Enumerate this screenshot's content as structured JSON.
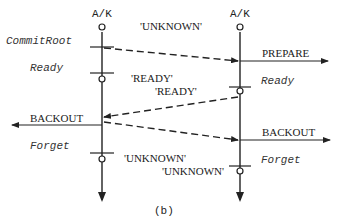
{
  "diagram": {
    "caption": "(b)",
    "participants": [
      {
        "id": "left",
        "label": "A/K"
      },
      {
        "id": "right",
        "label": "A/K"
      }
    ],
    "left_states": {
      "commit_root": "CommitRoot",
      "ready": "Ready",
      "forget": "Forget"
    },
    "right_states": {
      "ready": "Ready",
      "forget": "Forget"
    },
    "external_messages": {
      "prepare": "PREPARE",
      "backout_left": "BACKOUT",
      "backout_right": "BACKOUT"
    },
    "status_labels": {
      "unknown_top": "'UNKNOWN'",
      "ready_left": "'READY'",
      "ready_right": "'READY'",
      "unknown_bottom_left": "'UNKNOWN'",
      "unknown_bottom_right": "'UNKNOWN'"
    },
    "messages": [
      {
        "from": "left",
        "to": "right",
        "style": "dashed",
        "meaning": "prepare"
      },
      {
        "from": "right",
        "to": "left",
        "style": "dashed",
        "meaning": "ready"
      },
      {
        "from": "left",
        "to": "right",
        "style": "dashed",
        "meaning": "backout"
      }
    ]
  }
}
